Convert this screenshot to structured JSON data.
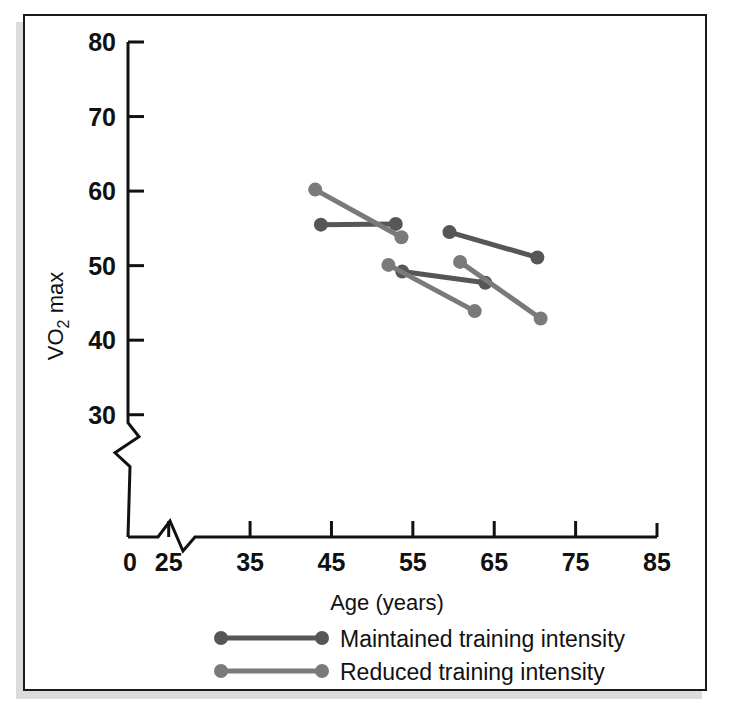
{
  "figure": {
    "background_color": "#ffffff",
    "frame_color": "#1a1a1a",
    "shadow_color": "#dcdcdc"
  },
  "chart_data": {
    "type": "scatter",
    "title": "",
    "subtitle": "",
    "xlabel": "Age (years)",
    "ylabel": "VO2 max",
    "ylabel_parts": {
      "pre": "VO",
      "sub": "2",
      "post": " max"
    },
    "xlim": [
      20,
      85
    ],
    "ylim": [
      25,
      80
    ],
    "x_ticks": [
      25,
      35,
      45,
      55,
      65,
      75,
      85
    ],
    "x_tick_labels": [
      "25",
      "35",
      "45",
      "55",
      "65",
      "75",
      "85"
    ],
    "x_origin_label": "0",
    "y_ticks": [
      30,
      40,
      50,
      60,
      70,
      80
    ],
    "y_tick_labels": [
      "30",
      "40",
      "50",
      "60",
      "70",
      "80"
    ],
    "grid": false,
    "x_axis_break": true,
    "y_axis_break": true,
    "legend_position": "below-plot",
    "series": [
      {
        "name": "Maintained training intensity",
        "color": "#565656",
        "marker": "circle",
        "segments": [
          {
            "x": [
              43.7,
              52.9
            ],
            "y": [
              55.5,
              55.6
            ]
          },
          {
            "x": [
              53.7,
              63.9
            ],
            "y": [
              49.2,
              47.7
            ]
          },
          {
            "x": [
              59.5,
              70.3
            ],
            "y": [
              54.5,
              51.1
            ]
          }
        ]
      },
      {
        "name": "Reduced training intensity",
        "color": "#7a7a7a",
        "marker": "circle",
        "segments": [
          {
            "x": [
              43.0,
              53.6
            ],
            "y": [
              60.2,
              53.8
            ]
          },
          {
            "x": [
              52.0,
              62.6
            ],
            "y": [
              50.1,
              43.9
            ]
          },
          {
            "x": [
              60.8,
              70.7
            ],
            "y": [
              50.5,
              42.9
            ]
          }
        ]
      }
    ],
    "legend_entries": [
      {
        "label": "Maintained training intensity",
        "color": "#565656"
      },
      {
        "label": "Reduced training intensity",
        "color": "#7a7a7a"
      }
    ]
  }
}
